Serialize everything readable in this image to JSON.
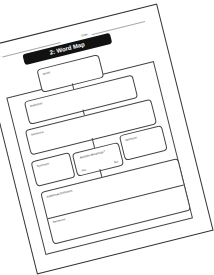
{
  "worksheet": {
    "title": "2: Word Map",
    "name_label": "Name",
    "date_label": "Date",
    "boxes": {
      "word": "Word:",
      "definition": "Definition:",
      "sentence": "Sentence:",
      "synonym": "Synonym:",
      "antonym": "Antonym:",
      "multiple_meanings": "Multiple Meanings?",
      "yes": "Yes",
      "no": "No",
      "additional_definition": "Additional Definition:",
      "sentence2": "Sentence:"
    }
  }
}
